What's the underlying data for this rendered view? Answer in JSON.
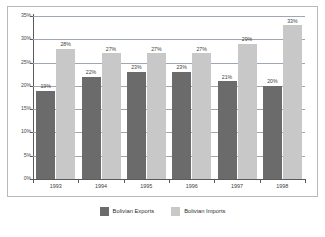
{
  "chart_data": {
    "type": "bar",
    "title": "",
    "subtitle": "",
    "xlabel": "",
    "ylabel": "",
    "categories": [
      "1993",
      "1994",
      "1995",
      "1996",
      "1997",
      "1998"
    ],
    "series": [
      {
        "name": "Bolivian Exports",
        "color": "#6b6b6b",
        "values": [
          19,
          22,
          23,
          23,
          21,
          20
        ],
        "labels": [
          "19%",
          "22%",
          "23%",
          "23%",
          "21%",
          "20%"
        ]
      },
      {
        "name": "Bolivian Imports",
        "color": "#c8c8c8",
        "values": [
          28,
          27,
          27,
          27,
          29,
          33
        ],
        "labels": [
          "28%",
          "27%",
          "27%",
          "27%",
          "29%",
          "33%"
        ]
      }
    ],
    "ylim": [
      0,
      35
    ],
    "ytick_values": [
      0,
      5,
      10,
      15,
      20,
      25,
      30,
      35
    ],
    "ytick_labels": [
      "0%",
      "5%",
      "10%",
      "15%",
      "20%",
      "25%",
      "30%",
      "35%"
    ],
    "grid": true,
    "legend_position": "bottom",
    "value_labels_shown": true,
    "units": "percent"
  },
  "legend": {
    "items": [
      {
        "label": "Bolivian Exports",
        "color": "#6b6b6b"
      },
      {
        "label": "Bolivian Imports",
        "color": "#c8c8c8"
      }
    ]
  },
  "colors": {
    "exports": "#6b6b6b",
    "imports": "#c8c8c8",
    "gridline": "#9fa6b4",
    "axis": "#5a5a5a",
    "frame": "#b9b9b9",
    "background": "#ffffff",
    "text": "#3d3d3d"
  }
}
